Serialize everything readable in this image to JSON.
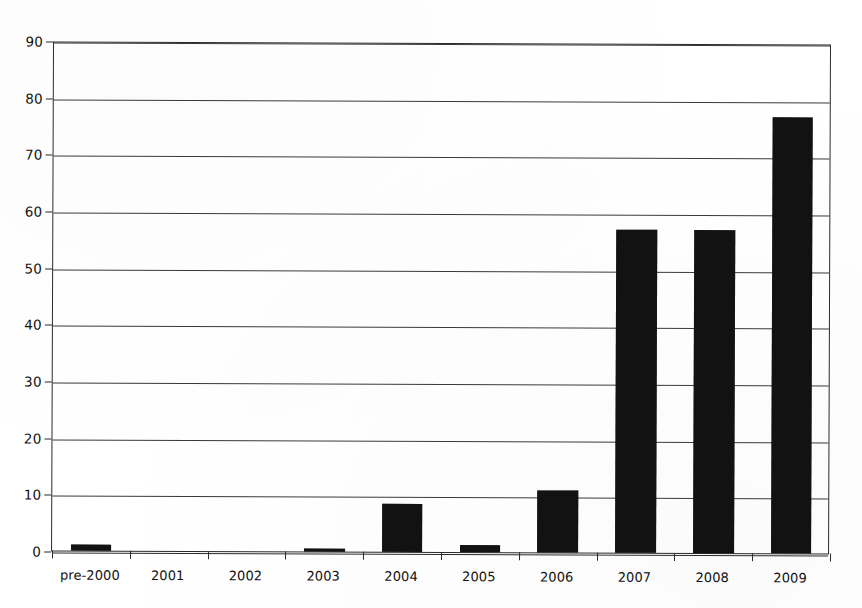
{
  "chart_data": {
    "type": "bar",
    "title": "",
    "subtitle": "",
    "xlabel": "",
    "ylabel": "",
    "categories": [
      "pre-2000",
      "2001",
      "2002",
      "2003",
      "2004",
      "2005",
      "2006",
      "2007",
      "2008",
      "2009"
    ],
    "values": [
      1,
      0,
      0,
      0.5,
      8.5,
      1.2,
      11,
      57,
      57,
      77
    ],
    "series": [
      {
        "name": "count",
        "values": [
          1,
          0,
          0,
          0.5,
          8.5,
          1.2,
          11,
          57,
          57,
          77
        ]
      }
    ],
    "ylim": [
      0,
      90
    ],
    "ytick_values": [
      0,
      10,
      20,
      30,
      40,
      50,
      60,
      70,
      80,
      90
    ],
    "ytick_labels": [
      "0",
      "10",
      "20",
      "30",
      "40",
      "50",
      "60",
      "70",
      "80",
      "90"
    ],
    "ystep": 10,
    "grid": true,
    "grid_axis": "y",
    "legend": false,
    "legend_position": "none",
    "bar_color": "#121212",
    "gridline_color": "#3a3a3a",
    "axis_color": "#2b2b2b",
    "background_color": "#ffffff",
    "bar_width_ratio": 0.52,
    "annotations": []
  },
  "figure": {
    "width": 862,
    "height": 608,
    "plot_left": 52,
    "plot_top": 43,
    "plot_width": 778,
    "plot_height": 510
  }
}
